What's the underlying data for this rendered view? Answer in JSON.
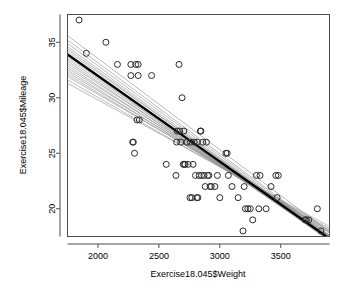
{
  "chart_data": {
    "type": "scatter",
    "title": "",
    "xlabel": "Exercise18.045$Weight",
    "ylabel": "Exercise18.045$Mileage",
    "xlim": [
      1750,
      3900
    ],
    "ylim": [
      17.5,
      37.5
    ],
    "xticks": [
      2000,
      2500,
      3000,
      3500
    ],
    "yticks": [
      20,
      25,
      30,
      35
    ],
    "xtick_labels": [
      "2000",
      "2500",
      "3000",
      "3500"
    ],
    "ytick_labels": [
      "20",
      "25",
      "30",
      "35"
    ],
    "grid": false,
    "legend": null,
    "point_marker": "open-circle",
    "point_color": "#2b2b2b",
    "fit_line_color": "#000000",
    "bootstrap_line_color": "#8c8c8c",
    "x": [
      1845,
      1905,
      2065,
      2160,
      2270,
      2270,
      2285,
      2290,
      2300,
      2310,
      2320,
      2330,
      2330,
      2340,
      2440,
      2560,
      2640,
      2645,
      2650,
      2665,
      2670,
      2680,
      2690,
      2700,
      2705,
      2710,
      2715,
      2730,
      2740,
      2755,
      2760,
      2770,
      2780,
      2790,
      2800,
      2810,
      2815,
      2820,
      2830,
      2840,
      2845,
      2850,
      2860,
      2870,
      2880,
      2890,
      2900,
      2910,
      2920,
      2930,
      2960,
      2980,
      3000,
      3050,
      3060,
      3070,
      3100,
      3150,
      3190,
      3200,
      3210,
      3230,
      3250,
      3270,
      3300,
      3320,
      3330,
      3380,
      3420,
      3460,
      3470,
      3480,
      3700,
      3710,
      3730,
      3800,
      3830
    ],
    "y": [
      37.0,
      34.0,
      35.0,
      33.0,
      33.0,
      32.0,
      26.0,
      26.0,
      25.0,
      33.0,
      28.0,
      33.0,
      32.0,
      28.0,
      32.0,
      24.0,
      23.0,
      26.0,
      27.0,
      33.0,
      27.0,
      26.0,
      30.0,
      24.0,
      27.0,
      24.0,
      24.0,
      26.0,
      24.0,
      21.0,
      26.0,
      21.0,
      24.0,
      26.0,
      23.0,
      21.0,
      26.0,
      21.0,
      23.0,
      27.0,
      27.0,
      23.0,
      26.0,
      23.0,
      22.0,
      26.0,
      23.0,
      23.0,
      22.0,
      22.0,
      22.0,
      23.0,
      21.0,
      25.0,
      25.0,
      23.0,
      22.0,
      21.0,
      18.0,
      22.0,
      20.0,
      20.0,
      20.0,
      19.0,
      23.0,
      20.0,
      23.0,
      20.0,
      22.0,
      23.0,
      21.0,
      23.0,
      19.0,
      19.0,
      19.0,
      20.0,
      18.0
    ],
    "fit_line": {
      "x0": 1750,
      "y0": 33.9,
      "x1": 3900,
      "y1": 17.3
    },
    "bootstrap_lines": [
      {
        "x0": 1750,
        "y0": 35.6,
        "x1": 3900,
        "y1": 17.9
      },
      {
        "x0": 1750,
        "y0": 35.2,
        "x1": 3900,
        "y1": 17.6
      },
      {
        "x0": 1750,
        "y0": 34.9,
        "x1": 3900,
        "y1": 17.5
      },
      {
        "x0": 1750,
        "y0": 34.6,
        "x1": 3900,
        "y1": 17.4
      },
      {
        "x0": 1750,
        "y0": 34.4,
        "x1": 3900,
        "y1": 17.3
      },
      {
        "x0": 1750,
        "y0": 34.2,
        "x1": 3900,
        "y1": 17.5
      },
      {
        "x0": 1750,
        "y0": 34.0,
        "x1": 3900,
        "y1": 17.2
      },
      {
        "x0": 1750,
        "y0": 33.8,
        "x1": 3900,
        "y1": 17.4
      },
      {
        "x0": 1750,
        "y0": 33.7,
        "x1": 3900,
        "y1": 17.1
      },
      {
        "x0": 1750,
        "y0": 33.5,
        "x1": 3900,
        "y1": 17.3
      },
      {
        "x0": 1750,
        "y0": 33.3,
        "x1": 3900,
        "y1": 17.2
      },
      {
        "x0": 1750,
        "y0": 33.1,
        "x1": 3900,
        "y1": 17.6
      },
      {
        "x0": 1750,
        "y0": 32.9,
        "x1": 3900,
        "y1": 17.4
      },
      {
        "x0": 1750,
        "y0": 32.7,
        "x1": 3900,
        "y1": 17.8
      },
      {
        "x0": 1750,
        "y0": 32.5,
        "x1": 3900,
        "y1": 17.6
      },
      {
        "x0": 1750,
        "y0": 32.3,
        "x1": 3900,
        "y1": 18.0
      },
      {
        "x0": 1750,
        "y0": 32.1,
        "x1": 3900,
        "y1": 17.9
      },
      {
        "x0": 1750,
        "y0": 31.9,
        "x1": 3900,
        "y1": 18.2
      },
      {
        "x0": 1750,
        "y0": 31.6,
        "x1": 3900,
        "y1": 18.1
      },
      {
        "x0": 1750,
        "y0": 31.3,
        "x1": 3900,
        "y1": 18.4
      }
    ]
  }
}
